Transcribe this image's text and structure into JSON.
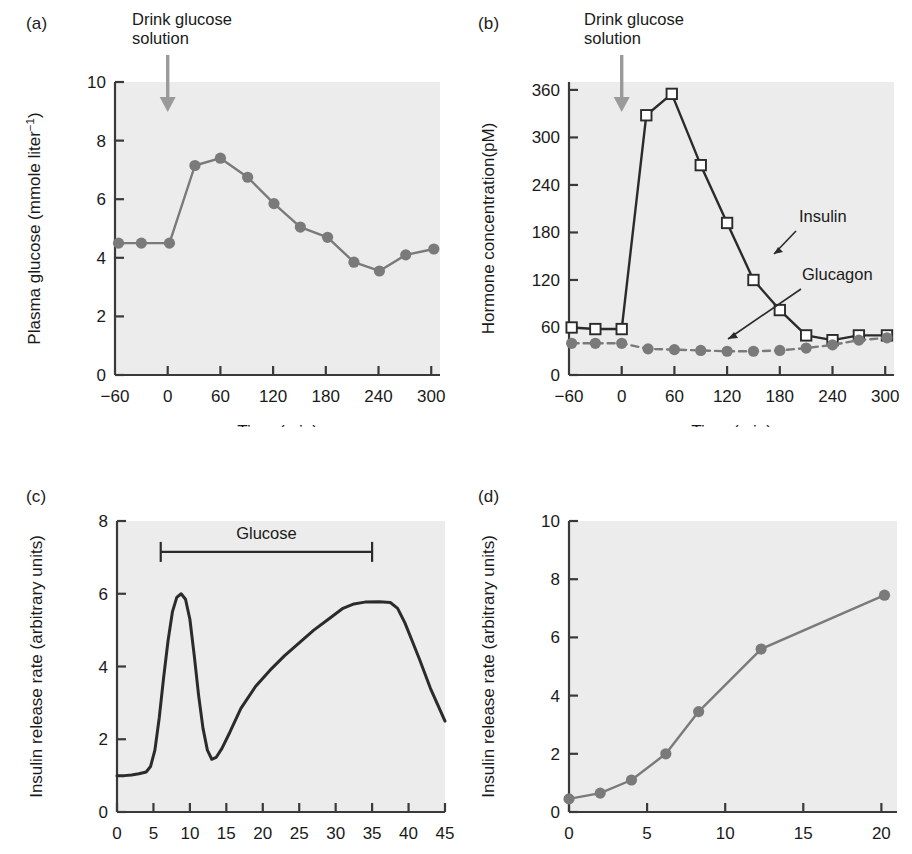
{
  "figure": {
    "panels": [
      "a",
      "b",
      "c",
      "d"
    ]
  },
  "panel_a": {
    "letter": "(a)",
    "annotation": "Drink glucose\nsolution",
    "arrow_at_time": 0
  },
  "panel_b": {
    "letter": "(b)",
    "annotation": "Drink glucose\nsolution",
    "arrow_at_time": 0,
    "label_insulin": "Insulin",
    "label_glucagon": "Glucagon"
  },
  "panel_c": {
    "letter": "(c)",
    "bar_label": "Glucose",
    "bar_start": 6,
    "bar_end": 35
  },
  "panel_d": {
    "letter": "(d)"
  },
  "colors": {
    "plot_background": "#ececec",
    "axis": "#3a3a3a",
    "marker_gray": "#7a7a7a",
    "line_gray": "#7a7a7a",
    "line_dark": "#2b2b2b",
    "arrow_gray": "#9a9a9a",
    "text": "#1a1a1a"
  },
  "chart_data": [
    {
      "id": "panel-a",
      "type": "line",
      "title": "(a)",
      "xlabel": "Time (min)",
      "ylabel": "Plasma glucose (mmole liter⁻¹)",
      "ylabel_base": "Plasma glucose (mmole liter",
      "ylabel_sup": "−1",
      "ylabel_tail": ")",
      "xlim": [
        -60,
        310
      ],
      "ylim": [
        0,
        10
      ],
      "xticks": [
        0,
        60,
        120,
        180,
        240,
        300
      ],
      "xticklabels": [
        "0",
        "60",
        "120",
        "180",
        "240",
        "300"
      ],
      "xaxis_end_label": "−60",
      "yticks": [
        0,
        2,
        4,
        6,
        8,
        10
      ],
      "yticklabels": [
        "0",
        "2",
        "4",
        "6",
        "8",
        "10"
      ],
      "grid": false,
      "marker": "filled-circle",
      "series": [
        {
          "name": "Plasma glucose",
          "x": [
            -56,
            -30,
            2,
            31,
            60,
            91,
            121,
            151,
            182,
            212,
            241,
            271,
            303
          ],
          "values": [
            4.5,
            4.5,
            4.5,
            7.15,
            7.4,
            6.75,
            5.85,
            5.05,
            4.7,
            3.85,
            3.55,
            4.1,
            4.3
          ]
        }
      ]
    },
    {
      "id": "panel-b",
      "type": "line",
      "title": "(b)",
      "xlabel": "Time (min)",
      "ylabel": "Hormone concentration(pM)",
      "xlim": [
        -60,
        310
      ],
      "ylim": [
        0,
        370
      ],
      "xticks": [
        0,
        60,
        120,
        180,
        240,
        300
      ],
      "xticklabels": [
        "0",
        "60",
        "120",
        "180",
        "240",
        "300"
      ],
      "xaxis_end_label": "−60",
      "yticks": [
        0,
        60,
        120,
        180,
        240,
        300,
        360
      ],
      "yticklabels": [
        "0",
        "60",
        "120",
        "180",
        "240",
        "300",
        "360"
      ],
      "grid": false,
      "series": [
        {
          "name": "Insulin",
          "marker": "open-square",
          "linestyle": "solid",
          "color": "#2b2b2b",
          "x": [
            -57,
            -30,
            0,
            28,
            57,
            90,
            120,
            150,
            180,
            210,
            240,
            270,
            302
          ],
          "values": [
            60,
            58,
            58,
            328,
            355,
            265,
            192,
            120,
            82,
            50,
            44,
            50,
            50
          ]
        },
        {
          "name": "Glucagon",
          "marker": "filled-circle",
          "linestyle": "dashed",
          "color": "#7a7a7a",
          "x": [
            -57,
            -30,
            0,
            30,
            60,
            90,
            120,
            150,
            180,
            210,
            240,
            270,
            302
          ],
          "values": [
            40,
            40,
            40,
            33,
            32,
            31,
            30,
            30,
            31,
            34,
            38,
            44,
            47
          ]
        }
      ]
    },
    {
      "id": "panel-c",
      "type": "line",
      "title": "(c)",
      "xlabel": "Time (min)",
      "ylabel": "Insulin release rate (arbitrary units)",
      "xlim": [
        0,
        45
      ],
      "ylim": [
        0,
        8
      ],
      "xticks": [
        0,
        5,
        10,
        15,
        20,
        25,
        30,
        35,
        40,
        45
      ],
      "xticklabels": [
        "0",
        "5",
        "10",
        "15",
        "20",
        "25",
        "30",
        "35",
        "40",
        "45"
      ],
      "yticks": [
        0,
        2,
        4,
        6,
        8
      ],
      "yticklabels": [
        "0",
        "2",
        "4",
        "6",
        "8"
      ],
      "grid": false,
      "annotation_bar": {
        "label": "Glucose",
        "start": 6,
        "end": 35,
        "y": 7.15
      },
      "series": [
        {
          "name": "Insulin release rate",
          "marker": "none",
          "linestyle": "solid",
          "color": "#2b2b2b",
          "x": [
            0,
            1,
            2,
            3,
            4,
            4.6,
            5.2,
            5.8,
            6.4,
            7,
            7.6,
            8.2,
            8.8,
            9.4,
            10,
            10.6,
            11.2,
            11.8,
            12.4,
            13,
            13.6,
            14.4,
            15.5,
            17,
            19,
            21,
            23,
            25,
            27,
            29,
            31,
            32.5,
            34,
            36,
            37.5,
            38.5,
            39.5,
            40.5,
            41.5,
            43,
            45
          ],
          "values": [
            1.0,
            1.0,
            1.02,
            1.05,
            1.1,
            1.25,
            1.7,
            2.6,
            3.7,
            4.7,
            5.5,
            5.9,
            6.0,
            5.85,
            5.3,
            4.3,
            3.2,
            2.3,
            1.7,
            1.45,
            1.5,
            1.75,
            2.2,
            2.85,
            3.45,
            3.9,
            4.3,
            4.65,
            5.0,
            5.3,
            5.6,
            5.72,
            5.77,
            5.78,
            5.76,
            5.6,
            5.2,
            4.7,
            4.2,
            3.4,
            2.5
          ]
        }
      ]
    },
    {
      "id": "panel-d",
      "type": "line",
      "title": "(d)",
      "xlabel": "Glucose concn. (mM)",
      "ylabel": "Insulin release rate (arbitrary units)",
      "xlim": [
        0,
        21
      ],
      "ylim": [
        0,
        10
      ],
      "xticks": [
        0,
        5,
        10,
        15,
        20
      ],
      "xticklabels": [
        "0",
        "5",
        "10",
        "15",
        "20"
      ],
      "yticks": [
        0,
        2,
        4,
        6,
        8,
        10
      ],
      "yticklabels": [
        "0",
        "2",
        "4",
        "6",
        "8",
        "10"
      ],
      "grid": false,
      "marker": "filled-circle",
      "series": [
        {
          "name": "Insulin release rate",
          "x": [
            0,
            2.0,
            4.0,
            6.2,
            8.3,
            12.3,
            20.2
          ],
          "values": [
            0.45,
            0.65,
            1.1,
            2.0,
            3.45,
            5.6,
            7.45
          ]
        }
      ]
    }
  ]
}
